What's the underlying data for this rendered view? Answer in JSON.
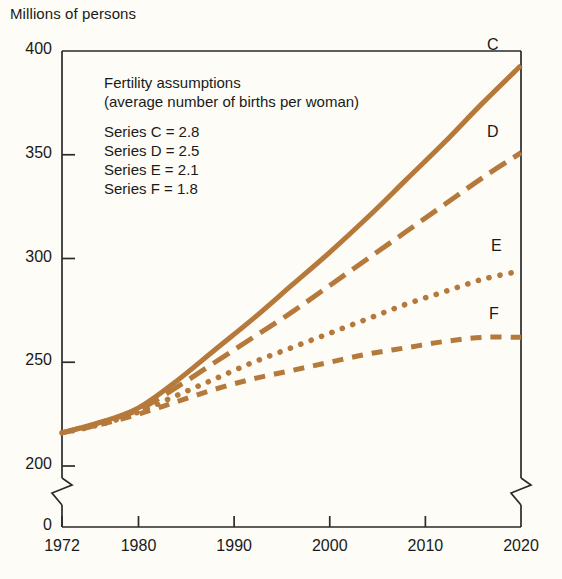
{
  "chart_data": {
    "type": "line",
    "title": "",
    "ylabel": "Millions of persons",
    "xlabel": "",
    "xlim": [
      1972,
      2020
    ],
    "ylim": [
      200,
      400
    ],
    "yticks": [
      200,
      250,
      300,
      350,
      400
    ],
    "ytick_labels": [
      "200",
      "250",
      "300",
      "350",
      "400"
    ],
    "axis_break_label": "0",
    "axis_break": true,
    "grid": false,
    "legend_position": "inside-upper-left",
    "xticks": [
      1972,
      1980,
      1990,
      2000,
      2010,
      2020
    ],
    "xtick_labels": [
      "1972",
      "1980",
      "1990",
      "2000",
      "2010",
      "2020"
    ],
    "line_color": "#b5793c",
    "x": [
      1972,
      1976,
      1980,
      1984,
      1988,
      1992,
      1996,
      2000,
      2004,
      2008,
      2012,
      2016,
      2020
    ],
    "series": [
      {
        "name": "C",
        "label": "C",
        "style": "solid",
        "assumption": "2.8",
        "values": [
          216,
          221,
          228,
          241,
          256,
          271,
          287,
          303,
          320,
          338,
          356,
          375,
          393
        ]
      },
      {
        "name": "D",
        "label": "D",
        "style": "long-dash",
        "assumption": "2.5",
        "values": [
          216,
          221,
          227,
          238,
          250,
          262,
          274,
          287,
          300,
          313,
          326,
          339,
          351
        ]
      },
      {
        "name": "E",
        "label": "E",
        "style": "dotted",
        "assumption": "2.1",
        "values": [
          216,
          220,
          226,
          234,
          242,
          250,
          257,
          264,
          271,
          278,
          284,
          290,
          294
        ]
      },
      {
        "name": "F",
        "label": "F",
        "style": "short-dash",
        "assumption": "1.8",
        "values": [
          216,
          220,
          225,
          231,
          237,
          242,
          246,
          250,
          254,
          257,
          260,
          262,
          262
        ]
      }
    ],
    "annotations": {
      "legend_heading_1": "Fertility assumptions",
      "legend_heading_2": "(average number of births per woman)",
      "legend_rows": [
        "Series C  =  2.8",
        "Series D  =  2.5",
        "Series E  =  2.1",
        "Series F  =  1.8"
      ]
    }
  }
}
